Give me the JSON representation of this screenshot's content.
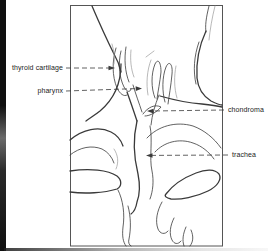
{
  "figure": {
    "labels": [
      {
        "id": "thyroid-cartilage",
        "text": "thyroid cartilage",
        "side": "left"
      },
      {
        "id": "pharynx",
        "text": "pharynx",
        "side": "left"
      },
      {
        "id": "chondroma",
        "text": "chondroma",
        "side": "right"
      },
      {
        "id": "trachea",
        "text": "trachea",
        "side": "right"
      }
    ],
    "colors": {
      "background": "#ffffff",
      "line": "#3a3a3a",
      "line_light": "#9a9a9a",
      "frame": "#555555",
      "label_text": "#222222",
      "edge_bar": "#0f0f0f"
    }
  }
}
